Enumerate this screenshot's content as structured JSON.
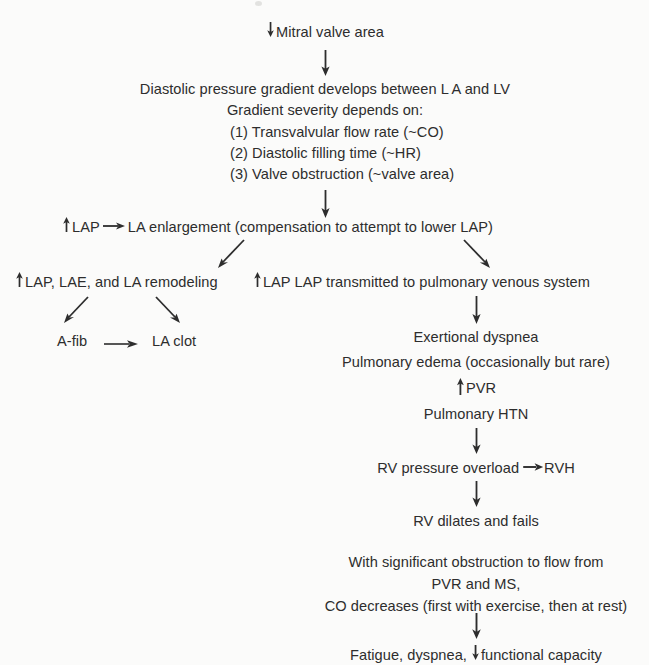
{
  "diagram": {
    "type": "flowchart",
    "background_color": "#fbfbfa",
    "text_color": "#2d2d2d",
    "nodes": {
      "mitral_valve_area": "Mitral valve area",
      "gradient_line1": "Diastolic pressure gradient develops between L A and LV",
      "gradient_line2": "Gradient severity depends on:",
      "factor1": "(1) Transvalvular flow rate (~CO)",
      "factor2": "(2) Diastolic filling time (~HR)",
      "factor3": "(3) Valve obstruction (~valve area)",
      "lap": "LAP",
      "la_enlargement": "LA enlargement (compensation to attempt to lower LAP)",
      "lap_lae_remodeling": "LAP, LAE, and LA remodeling",
      "lap_transmitted": "LAP transmitted to pulmonary venous system",
      "afib": "A-fib",
      "la_clot": "LA clot",
      "exertional_dyspnea": "Exertional dyspnea",
      "pulmonary_edema": "Pulmonary edema (occasionally but rare)",
      "pvr": "PVR",
      "pulmonary_htn": "Pulmonary HTN",
      "rv_pressure_overload": "RV pressure overload",
      "rvh": "RVH",
      "rv_dilates": "RV dilates and fails",
      "obstruction_line1": "With significant obstruction to flow from",
      "obstruction_line2": "PVR and MS,",
      "obstruction_line3": "CO decreases (first with exercise, then at rest)",
      "fatigue_pre": "Fatigue, dyspnea,",
      "fatigue_post": "functional capacity"
    },
    "glyphs": {
      "down_arrow": "down-arrow-glyph",
      "up_arrow": "up-arrow-glyph",
      "right_arrow": "right-arrow-glyph"
    }
  }
}
